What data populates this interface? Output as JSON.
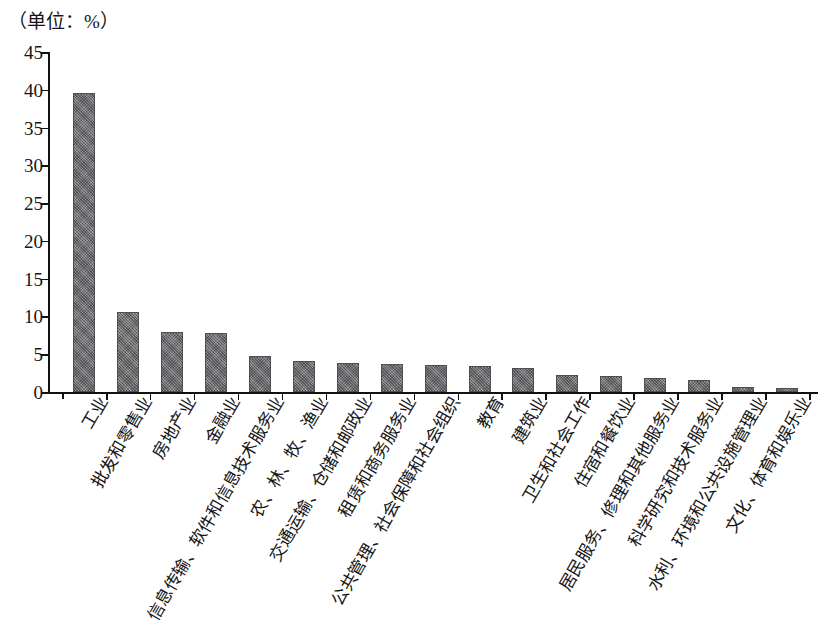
{
  "caption": "（单位：%）",
  "chart_data": {
    "type": "bar",
    "title": "",
    "subtitle": "",
    "unit_note": "（单位：%）",
    "xlabel": "",
    "ylabel": "",
    "ylim": [
      0,
      45
    ],
    "ytick_step": 5,
    "grid": false,
    "legend": null,
    "bar_color": "#76767a",
    "axis_color": "#111111",
    "ytick_labels": [
      "0",
      "5",
      "10",
      "15",
      "20",
      "25",
      "30",
      "35",
      "40",
      "45"
    ],
    "ytick_values": [
      0,
      5,
      10,
      15,
      20,
      25,
      30,
      35,
      40,
      45
    ],
    "categories": [
      "工业",
      "批发和零售业",
      "房地产业",
      "金融业",
      "信息传输、软件和信息技术服务业",
      "农、林、牧、渔业",
      "交通运输、仓储和邮政业",
      "租赁和商务服务业",
      "公共管理、社会保障和社会组织",
      "教育",
      "建筑业",
      "卫生和社会工作",
      "住宿和餐饮业",
      "居民服务、修理和其他服务业",
      "科学研究和技术服务业",
      "水利、环境和公共设施管理业",
      "文化、体育和娱乐业"
    ],
    "values": [
      39.6,
      10.6,
      7.9,
      7.8,
      4.8,
      4.1,
      3.8,
      3.7,
      3.6,
      3.4,
      3.2,
      2.2,
      2.1,
      1.8,
      1.6,
      0.7,
      0.5
    ]
  }
}
